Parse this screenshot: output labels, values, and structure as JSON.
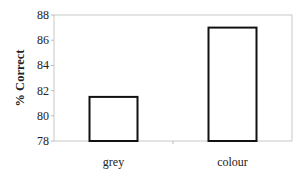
{
  "chart_data": {
    "type": "bar",
    "title": "",
    "xlabel": "",
    "ylabel": "% Correct",
    "categories": [
      "grey",
      "colour"
    ],
    "values": [
      81.5,
      87.0
    ],
    "ylim": [
      78,
      88
    ],
    "yticks": [
      "78",
      "80",
      "82",
      "84",
      "86",
      "88"
    ],
    "grid": false,
    "legend": null,
    "bar_fill": "#ffffff",
    "bar_stroke": "#111111"
  }
}
